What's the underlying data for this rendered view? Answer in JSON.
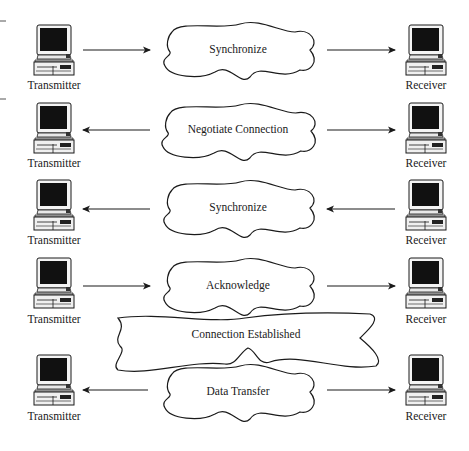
{
  "colors": {
    "stroke": "#1a1a1a",
    "screen": "#111111",
    "background": "#ffffff"
  },
  "nodes": {
    "left_label": "Transmitter",
    "right_label": "Receiver"
  },
  "rows": [
    {
      "step": "Synchronize",
      "left_arrow": "right",
      "right_arrow": "right"
    },
    {
      "step": "Negotiate Connection",
      "left_arrow": "left",
      "right_arrow": "right"
    },
    {
      "step": "Synchronize",
      "left_arrow": "left",
      "right_arrow": "left"
    },
    {
      "step": "Acknowledge",
      "left_arrow": "right",
      "right_arrow": "right"
    },
    {
      "step": "Data Transfer",
      "left_arrow": "left",
      "right_arrow": "right"
    }
  ],
  "banner": {
    "label": "Connection Established"
  },
  "labels": {
    "t0": "Transmitter",
    "t1": "Transmitter",
    "t2": "Transmitter",
    "t3": "Transmitter",
    "t4": "Transmitter",
    "r0": "Receiver",
    "r1": "Receiver",
    "r2": "Receiver",
    "r3": "Receiver",
    "r4": "Receiver"
  }
}
